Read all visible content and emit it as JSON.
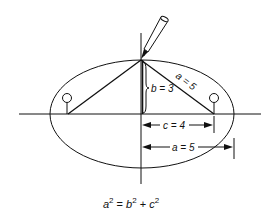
{
  "diagram": {
    "labels": {
      "b": "b = 3",
      "a_slant": "a = 5",
      "c": "c = 4",
      "a_horizontal": "a = 5"
    },
    "formula": {
      "a": "a",
      "b": "b",
      "c": "c",
      "exp": "2",
      "eq": " = ",
      "plus": " + "
    },
    "values": {
      "a": 5,
      "b": 3,
      "c": 4
    },
    "colors": {
      "stroke": "#111111",
      "background": "#ffffff"
    }
  }
}
